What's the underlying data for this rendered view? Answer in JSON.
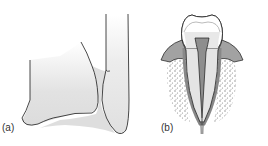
{
  "figure": {
    "panels": [
      {
        "id": "a",
        "label": "(a)",
        "description": "Joint with two bones connected by a fibrous ligament (hatched)"
      },
      {
        "id": "b",
        "label": "(b)",
        "description": "Tooth in socket: crown, pulp cavity, root, gum and alveolar bone"
      }
    ]
  },
  "colors": {
    "outline": "#1a1a1a",
    "bone_fill": "#e6e6e6",
    "gum_fill": "#9a9a9a",
    "pulp_fill": "#8c8c8c",
    "dentin_fill": "#e4e4e4",
    "enamel_fill": "#ffffff",
    "dots": "#8a8a8a",
    "hatch": "#6a6a6a"
  }
}
